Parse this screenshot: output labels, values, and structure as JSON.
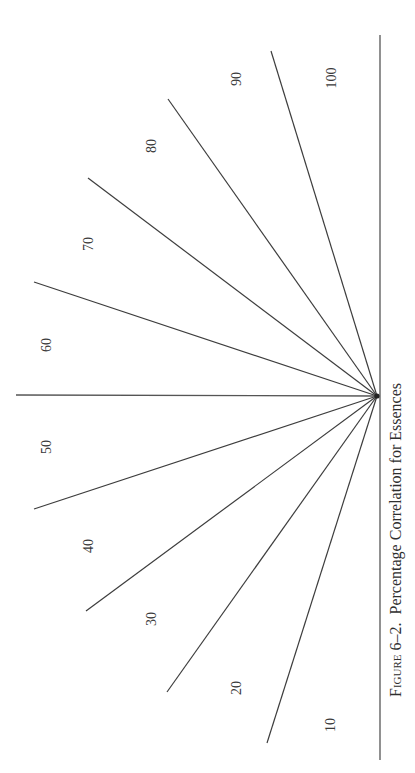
{
  "figure": {
    "caption_prefix": "Figure 6–2.",
    "caption_text": "Percentage Correlation for Essences",
    "caption": "Figure 6–2. Percentage Correlation for Essences",
    "labels": [
      "10",
      "20",
      "30",
      "40",
      "50",
      "60",
      "70",
      "80",
      "90",
      "100"
    ]
  },
  "diagram": {
    "type": "radial-fan",
    "center": [
      377,
      396
    ],
    "divider_count": 9,
    "sectors": 10,
    "sector_labels": [
      "10",
      "20",
      "30",
      "40",
      "50",
      "60",
      "70",
      "80",
      "90",
      "100"
    ],
    "colors": {
      "line": "#3d3d3d",
      "text": "#3a3a3a",
      "background": "#ffffff"
    }
  }
}
